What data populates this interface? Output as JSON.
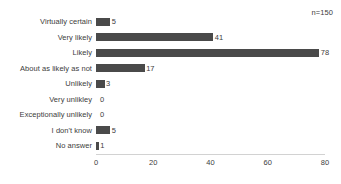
{
  "chart_data": {
    "type": "bar",
    "orientation": "horizontal",
    "title": "",
    "xlabel": "",
    "ylabel": "",
    "xlim": [
      0,
      80
    ],
    "xticks": [
      0,
      20,
      40,
      60,
      80
    ],
    "grid": false,
    "legend": null,
    "bar_color": "#4a4a4a",
    "annotation": "n=150",
    "categories": [
      "Virtually certain",
      "Very likely",
      "Likely",
      "About as likely as not",
      "Unlikely",
      "Very unlikley",
      "Exceptionally unlikely",
      "I don't know",
      "No answer"
    ],
    "values": [
      5,
      41,
      78,
      17,
      3,
      0,
      0,
      5,
      1
    ],
    "value_labels": [
      "5",
      "41",
      "78",
      "17",
      "3",
      "0",
      "0",
      "5",
      "1"
    ]
  },
  "axis": {
    "tick_labels": [
      "0",
      "20",
      "40",
      "60",
      "80"
    ]
  }
}
